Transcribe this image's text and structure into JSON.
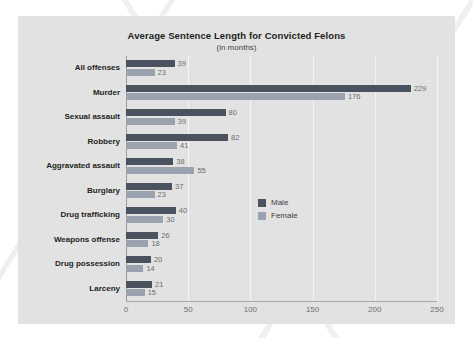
{
  "chart_data": {
    "type": "bar",
    "orientation": "horizontal",
    "title": "Average Sentence Length for Convicted Felons",
    "subtitle": "(in months)",
    "xlabel": "",
    "ylabel": "",
    "xlim": [
      0,
      250
    ],
    "xticks": [
      0,
      50,
      100,
      150,
      200,
      250
    ],
    "grid": true,
    "legend_position": "center-right",
    "categories": [
      "All offenses",
      "Murder",
      "Sexual assault",
      "Robbery",
      "Aggravated assault",
      "Burglary",
      "Drug trafficking",
      "Weapons offense",
      "Drug possession",
      "Larceny"
    ],
    "series": [
      {
        "name": "Male",
        "color": "#4a5260",
        "values": [
          39,
          229,
          80,
          82,
          38,
          37,
          40,
          26,
          20,
          21
        ]
      },
      {
        "name": "Female",
        "color": "#9aa3ad",
        "values": [
          23,
          176,
          39,
          41,
          55,
          23,
          30,
          18,
          14,
          15
        ]
      }
    ]
  },
  "colors": {
    "panel_background": "#e2e2e2",
    "page_background": "#ffffff",
    "male": "#4a5260",
    "female": "#9aa3ad",
    "axis": "#9a9a9a",
    "gridline": "#f4f4f4",
    "title_text": "#231f20",
    "value_text": "#6d6d6d"
  }
}
